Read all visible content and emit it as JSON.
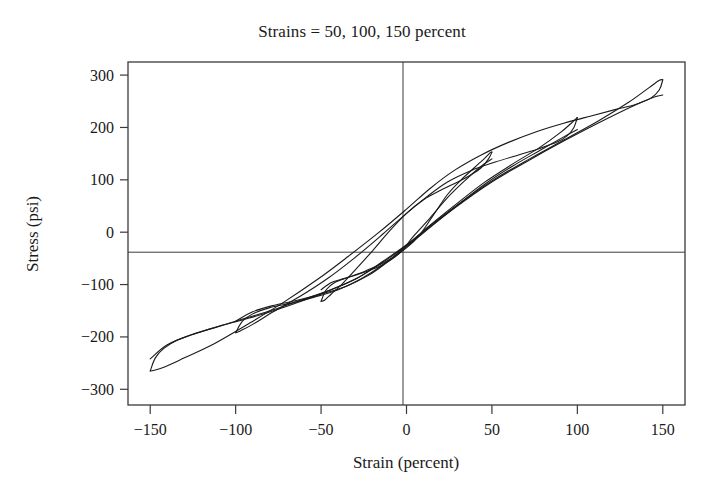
{
  "chart_data": {
    "type": "line",
    "title": "Strains = 50, 100, 150 percent",
    "xlabel": "Strain (percent)",
    "ylabel": "Stress (psi)",
    "xlim": [
      -163,
      163
    ],
    "ylim": [
      -330,
      325
    ],
    "xticks": [
      -150,
      -100,
      -50,
      0,
      50,
      100,
      150
    ],
    "xtick_labels": [
      "−150",
      "−100",
      "−50",
      "0",
      "50",
      "100",
      "150"
    ],
    "yticks": [
      300,
      200,
      100,
      0,
      -100,
      -200,
      -300
    ],
    "ytick_labels": [
      "300",
      "200",
      "100",
      "0",
      "−100",
      "−200",
      "−300"
    ],
    "grid": false,
    "legend": "none",
    "zero_axes": true,
    "line_color": "#1a1a1a",
    "line_width": 1.1,
    "background": "#ffffff",
    "frame_color": "#3a3a3a",
    "series": [
      {
        "name": "50 percent strain cycle",
        "amplitude_percent": 50,
        "peak_stress_psi": 152,
        "min_stress_psi": -132,
        "loading_path": [
          [
            -50,
            -132
          ],
          [
            -47,
            -110
          ],
          [
            -42,
            -96
          ],
          [
            -34,
            -86
          ],
          [
            -24,
            -74
          ],
          [
            -12,
            -56
          ],
          [
            0,
            -30
          ],
          [
            8,
            -4
          ],
          [
            16,
            34
          ],
          [
            24,
            72
          ],
          [
            32,
            100
          ],
          [
            40,
            124
          ],
          [
            46,
            142
          ],
          [
            49,
            152
          ],
          [
            50,
            153
          ]
        ],
        "unloading_path": [
          [
            50,
            153
          ],
          [
            48,
            140
          ],
          [
            44,
            124
          ],
          [
            38,
            110
          ],
          [
            30,
            96
          ],
          [
            20,
            80
          ],
          [
            10,
            62
          ],
          [
            0,
            36
          ],
          [
            -10,
            2
          ],
          [
            -20,
            -36
          ],
          [
            -30,
            -72
          ],
          [
            -38,
            -100
          ],
          [
            -44,
            -118
          ],
          [
            -48,
            -130
          ],
          [
            -50,
            -132
          ]
        ]
      },
      {
        "name": "100 percent strain cycle",
        "amplitude_percent": 100,
        "peak_stress_psi": 218,
        "min_stress_psi": -192,
        "loading_path": [
          [
            -100,
            -192
          ],
          [
            -96,
            -170
          ],
          [
            -90,
            -156
          ],
          [
            -80,
            -144
          ],
          [
            -68,
            -136
          ],
          [
            -54,
            -124
          ],
          [
            -40,
            -110
          ],
          [
            -26,
            -88
          ],
          [
            -12,
            -58
          ],
          [
            0,
            -26
          ],
          [
            14,
            14
          ],
          [
            30,
            56
          ],
          [
            46,
            96
          ],
          [
            62,
            130
          ],
          [
            78,
            162
          ],
          [
            90,
            190
          ],
          [
            97,
            210
          ],
          [
            100,
            219
          ]
        ],
        "unloading_path": [
          [
            100,
            219
          ],
          [
            98,
            200
          ],
          [
            94,
            184
          ],
          [
            88,
            172
          ],
          [
            78,
            160
          ],
          [
            66,
            148
          ],
          [
            52,
            134
          ],
          [
            38,
            118
          ],
          [
            24,
            96
          ],
          [
            12,
            68
          ],
          [
            0,
            36
          ],
          [
            -14,
            -4
          ],
          [
            -30,
            -48
          ],
          [
            -46,
            -88
          ],
          [
            -62,
            -122
          ],
          [
            -78,
            -152
          ],
          [
            -90,
            -176
          ],
          [
            -97,
            -188
          ],
          [
            -100,
            -192
          ]
        ]
      },
      {
        "name": "150 percent strain cycle",
        "amplitude_percent": 150,
        "peak_stress_psi": 291,
        "min_stress_psi": -265,
        "loading_path": [
          [
            -150,
            -265
          ],
          [
            -147,
            -240
          ],
          [
            -142,
            -222
          ],
          [
            -134,
            -206
          ],
          [
            -122,
            -192
          ],
          [
            -108,
            -178
          ],
          [
            -92,
            -164
          ],
          [
            -76,
            -148
          ],
          [
            -60,
            -130
          ],
          [
            -44,
            -110
          ],
          [
            -28,
            -86
          ],
          [
            -14,
            -56
          ],
          [
            0,
            -24
          ],
          [
            16,
            18
          ],
          [
            34,
            62
          ],
          [
            52,
            102
          ],
          [
            72,
            140
          ],
          [
            92,
            176
          ],
          [
            112,
            212
          ],
          [
            130,
            248
          ],
          [
            142,
            276
          ],
          [
            148,
            290
          ],
          [
            150,
            291
          ]
        ],
        "unloading_path": [
          [
            150,
            291
          ],
          [
            148,
            272
          ],
          [
            143,
            256
          ],
          [
            134,
            244
          ],
          [
            122,
            234
          ],
          [
            108,
            222
          ],
          [
            92,
            208
          ],
          [
            76,
            192
          ],
          [
            60,
            172
          ],
          [
            44,
            148
          ],
          [
            28,
            118
          ],
          [
            14,
            84
          ],
          [
            0,
            44
          ],
          [
            -16,
            0
          ],
          [
            -34,
            -46
          ],
          [
            -52,
            -90
          ],
          [
            -72,
            -134
          ],
          [
            -92,
            -174
          ],
          [
            -112,
            -212
          ],
          [
            -130,
            -240
          ],
          [
            -142,
            -258
          ],
          [
            -148,
            -264
          ],
          [
            -150,
            -265
          ]
        ]
      }
    ],
    "secondary_paths": [
      {
        "name": "150 percent second cycle loading",
        "points": [
          [
            -150,
            -242
          ],
          [
            -140,
            -215
          ],
          [
            -126,
            -196
          ],
          [
            -110,
            -180
          ],
          [
            -94,
            -164
          ],
          [
            -78,
            -148
          ],
          [
            -62,
            -130
          ],
          [
            -46,
            -112
          ],
          [
            -30,
            -90
          ],
          [
            -16,
            -62
          ],
          [
            0,
            -26
          ],
          [
            16,
            16
          ],
          [
            34,
            60
          ],
          [
            52,
            100
          ],
          [
            72,
            138
          ],
          [
            92,
            174
          ],
          [
            112,
            208
          ],
          [
            132,
            240
          ],
          [
            145,
            258
          ],
          [
            150,
            262
          ]
        ]
      },
      {
        "name": "100 percent second cycle loading",
        "points": [
          [
            -100,
            -170
          ],
          [
            -90,
            -152
          ],
          [
            -78,
            -140
          ],
          [
            -64,
            -130
          ],
          [
            -50,
            -118
          ],
          [
            -36,
            -104
          ],
          [
            -22,
            -82
          ],
          [
            -10,
            -54
          ],
          [
            0,
            -28
          ],
          [
            14,
            10
          ],
          [
            30,
            52
          ],
          [
            46,
            92
          ],
          [
            62,
            126
          ],
          [
            78,
            156
          ],
          [
            92,
            182
          ],
          [
            100,
            196
          ]
        ]
      },
      {
        "name": "50 percent second cycle loading",
        "points": [
          [
            -50,
            -110
          ],
          [
            -44,
            -96
          ],
          [
            -36,
            -88
          ],
          [
            -26,
            -78
          ],
          [
            -14,
            -62
          ],
          [
            -4,
            -40
          ],
          [
            4,
            -8
          ],
          [
            14,
            28
          ],
          [
            24,
            66
          ],
          [
            34,
            98
          ],
          [
            43,
            124
          ],
          [
            50,
            140
          ]
        ]
      }
    ]
  }
}
